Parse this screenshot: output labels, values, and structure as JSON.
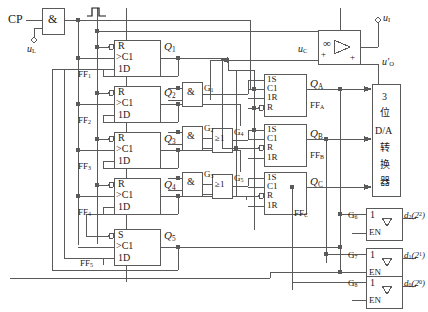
{
  "inputs": {
    "clock_label": "CP",
    "control_label": "u_L",
    "analog_in_label": "u_I",
    "compare_label": "u_C",
    "dac_out_label": "u_O'"
  },
  "gates": {
    "clock_and": "&",
    "pulse_symbol": "pulse",
    "and_g1": "&",
    "and_g2": "&",
    "and_g3": "&",
    "or_g4": "≥1",
    "or_g5": "≥1",
    "g1_label": "G1",
    "g2_label": "G2",
    "g3_label": "G3",
    "g4_label": "G4",
    "g5_label": "G5",
    "g6_label": "G6",
    "g7_label": "G7",
    "g8_label": "G8"
  },
  "ring_flipflops": [
    {
      "name": "FF1",
      "set_reset": "R",
      "clk": ">C1",
      "data": "1D",
      "q": "Q1"
    },
    {
      "name": "FF2",
      "set_reset": "R",
      "clk": ">C1",
      "data": "1D",
      "q": "Q2"
    },
    {
      "name": "FF3",
      "set_reset": "R",
      "clk": ">C1",
      "data": "1D",
      "q": "Q3"
    },
    {
      "name": "FF4",
      "set_reset": "R",
      "clk": ">C1",
      "data": "1D",
      "q": "Q4"
    },
    {
      "name": "FF5",
      "set_reset": "S",
      "clk": ">C1",
      "data": "1D",
      "q": "Q5"
    }
  ],
  "register_flipflops": [
    {
      "name": "FFA",
      "pins": [
        "1S",
        "C1",
        "1R",
        "R"
      ],
      "q": "QA"
    },
    {
      "name": "FFB",
      "pins": [
        "1S",
        "C1",
        "R",
        "1R"
      ],
      "q": "QB"
    },
    {
      "name": "FFC",
      "pins": [
        "1S",
        "C1",
        "R",
        "1R"
      ],
      "q": "QC"
    }
  ],
  "dac": {
    "line1": "3",
    "line2": "位",
    "line3": "D/A",
    "line4": "转",
    "line5": "换",
    "line6": "器"
  },
  "buffers": [
    {
      "gate": "G6",
      "in": "1",
      "en": "EN",
      "tri": "▽",
      "out": "d2(2^2)"
    },
    {
      "gate": "G7",
      "in": "1",
      "en": "EN",
      "tri": "▽",
      "out": "d1(2^1)"
    },
    {
      "gate": "G8",
      "in": "1",
      "en": "EN",
      "tri": "▽",
      "out": "d0(2^0)"
    }
  ],
  "comparator": {
    "gain_symbol": "∞",
    "plus_left": "+",
    "plus_bottom": "+"
  },
  "colors": {
    "line": "#5a5a5a",
    "text": "#1a1a1a",
    "background": "#ffffff"
  }
}
